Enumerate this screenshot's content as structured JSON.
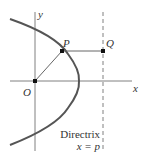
{
  "diagram": {
    "labels": {
      "y_axis": "y",
      "x_axis": "x",
      "origin": "O",
      "point_p": "P",
      "point_q": "Q",
      "directrix_title": "Directrix",
      "directrix_eq": "x = p"
    },
    "colors": {
      "curve": "#555555",
      "axes": "#777777",
      "segments": "#666666",
      "points": "#111111",
      "text": "#333333"
    }
  }
}
